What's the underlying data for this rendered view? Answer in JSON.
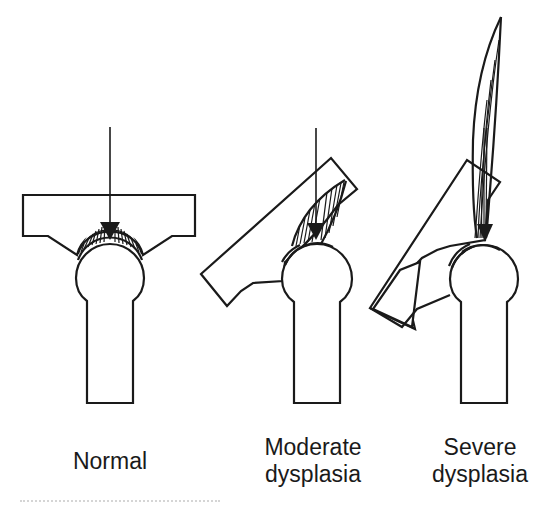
{
  "figure": {
    "panels": [
      {
        "id": "normal",
        "label_lines": [
          "Normal"
        ],
        "force_vector": "single vertical arrow centered on femoral head",
        "stress_distribution": "broad hatched semicircle over head"
      },
      {
        "id": "moderate",
        "label_lines": [
          "Moderate",
          "dysplasia"
        ],
        "force_vector": "single vertical arrow, acetabulum tilted",
        "stress_distribution": "hatched region concentrated at lateral edge"
      },
      {
        "id": "severe",
        "label_lines": [
          "Severe",
          "dysplasia"
        ],
        "force_vector": "arrow with very tall narrow stress peak",
        "stress_distribution": "narrow spike extending far above joint"
      }
    ],
    "colors": {
      "ink": "#1a1a1a",
      "background": "#ffffff"
    }
  }
}
